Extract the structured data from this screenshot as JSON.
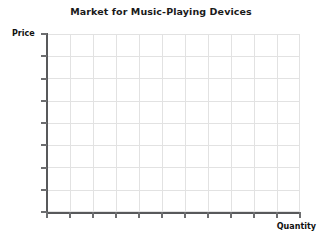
{
  "chart_data": {
    "type": "line",
    "title": "Market for Music-Playing Devices",
    "subtitle": "",
    "xlabel": "Quantity",
    "ylabel": "Price",
    "series": [],
    "categories": [],
    "x": [],
    "values": [],
    "xtick_labels": [],
    "ytick_labels": [],
    "x_major_ticks": 11,
    "y_major_ticks": 8,
    "grid": true,
    "legend": "none",
    "annotations": [],
    "note": "Empty graph template: axes and gridlines drawn with no data plotted."
  },
  "colors": {
    "axis": "#58595b",
    "tick": "#6d6e70",
    "grid": "#e2e2e2",
    "title_text": "#1a1a1a",
    "label_text": "#111111",
    "background": "#ffffff"
  },
  "grid_layout": {
    "vertical_line_positions": [
      0,
      23,
      46,
      69,
      92,
      115,
      138,
      161,
      184,
      207,
      230,
      252
    ],
    "horizontal_line_positions": [
      0,
      22,
      44,
      67,
      89,
      111,
      133,
      156,
      177
    ],
    "x_tick_positions": [
      46,
      69,
      92,
      115,
      138,
      161,
      184,
      207,
      230,
      253,
      276,
      299
    ],
    "y_tick_positions": [
      33,
      55,
      78,
      100,
      122,
      144,
      167,
      189,
      211
    ]
  }
}
